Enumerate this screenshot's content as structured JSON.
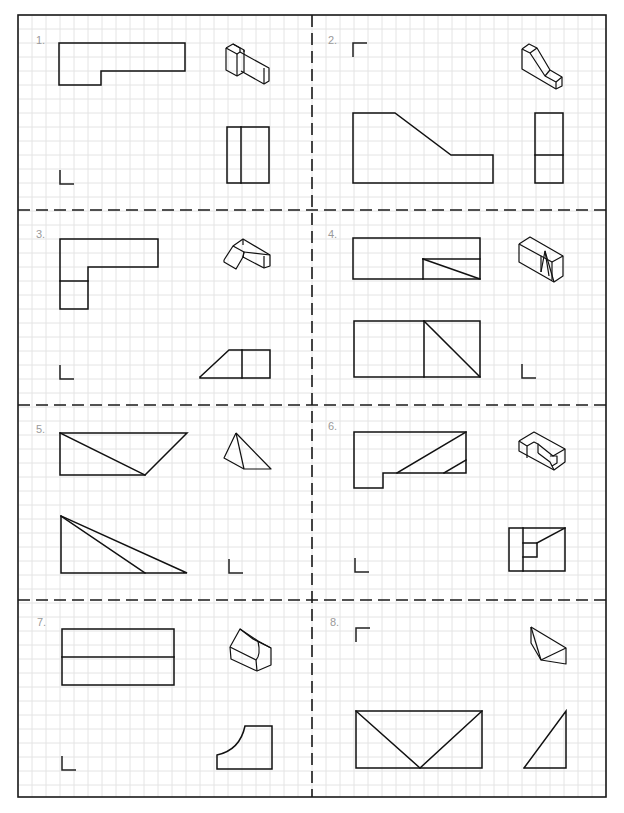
{
  "worksheet": {
    "width": 624,
    "height": 813,
    "grid": {
      "pitch": 14,
      "origin_x": 18,
      "origin_y": 15,
      "color": "#e4e4e4"
    },
    "frame": {
      "x": 18,
      "y": 15,
      "w": 588,
      "h": 782,
      "color": "#1a1a1a"
    },
    "dividers": {
      "vertical_x": 312,
      "horizontal_y": [
        210,
        405,
        600
      ]
    }
  },
  "problems": [
    {
      "number": "1.",
      "label_pos": [
        36,
        44
      ],
      "front_view": [
        [
          [
            59,
            43
          ],
          [
            185,
            43
          ],
          [
            185,
            71
          ],
          [
            101,
            71
          ],
          [
            101,
            85
          ],
          [
            59,
            85
          ],
          [
            59,
            43
          ]
        ]
      ],
      "side_view": [
        [
          [
            227,
            127
          ],
          [
            269,
            127
          ],
          [
            269,
            183
          ],
          [
            227,
            183
          ],
          [
            227,
            127
          ]
        ],
        [
          [
            241,
            127
          ],
          [
            241,
            183
          ]
        ]
      ],
      "top_view_marker": {
        "type": "L-bottom-left",
        "x": 60,
        "y": 170
      },
      "isometric": [
        [
          [
            226,
            48
          ],
          [
            233,
            44
          ],
          [
            244,
            50
          ],
          [
            244,
            72
          ],
          [
            237,
            76
          ],
          [
            226,
            70
          ],
          [
            226,
            48
          ]
        ],
        [
          [
            233,
            44
          ],
          [
            240,
            48
          ],
          [
            240,
            52
          ]
        ],
        [
          [
            237,
            54
          ],
          [
            237,
            76
          ]
        ],
        [
          [
            240,
            52
          ],
          [
            269,
            68
          ],
          [
            269,
            81
          ],
          [
            264,
            84
          ],
          [
            241,
            71
          ]
        ],
        [
          [
            244,
            50
          ],
          [
            244,
            52
          ]
        ],
        [
          [
            264,
            68
          ],
          [
            264,
            84
          ]
        ],
        [
          [
            226,
            48
          ],
          [
            237,
            54
          ],
          [
            240,
            52
          ]
        ]
      ]
    },
    {
      "number": "2.",
      "label_pos": [
        328,
        44
      ],
      "front_view": [
        [
          [
            353,
            113
          ],
          [
            395,
            113
          ],
          [
            451,
            155
          ],
          [
            493,
            155
          ],
          [
            493,
            183
          ],
          [
            353,
            183
          ],
          [
            353,
            113
          ]
        ]
      ],
      "side_view": [
        [
          [
            535,
            113
          ],
          [
            563,
            113
          ],
          [
            563,
            183
          ],
          [
            535,
            183
          ],
          [
            535,
            113
          ]
        ],
        [
          [
            535,
            155
          ],
          [
            563,
            155
          ]
        ]
      ],
      "top_view_marker": {
        "type": "L-top-left",
        "x": 353,
        "y": 43
      },
      "isometric": [
        [
          [
            522,
            49
          ],
          [
            529,
            44
          ],
          [
            537,
            48
          ],
          [
            550,
            70
          ],
          [
            562,
            77
          ],
          [
            562,
            86
          ],
          [
            556,
            89
          ],
          [
            522,
            69
          ],
          [
            522,
            49
          ]
        ],
        [
          [
            522,
            49
          ],
          [
            530,
            53
          ],
          [
            545,
            76
          ],
          [
            556,
            82
          ],
          [
            556,
            89
          ]
        ],
        [
          [
            530,
            53
          ],
          [
            537,
            48
          ]
        ],
        [
          [
            545,
            76
          ],
          [
            550,
            70
          ]
        ],
        [
          [
            556,
            82
          ],
          [
            562,
            77
          ]
        ]
      ]
    },
    {
      "number": "3.",
      "label_pos": [
        36,
        238
      ],
      "front_view": [
        [
          [
            60,
            239
          ],
          [
            158,
            239
          ],
          [
            158,
            267
          ],
          [
            88,
            267
          ],
          [
            88,
            309
          ],
          [
            60,
            309
          ],
          [
            60,
            239
          ]
        ],
        [
          [
            60,
            281
          ],
          [
            88,
            281
          ]
        ]
      ],
      "side_view": [
        [
          [
            200,
            377
          ],
          [
            229,
            350
          ],
          [
            270,
            350
          ],
          [
            270,
            378
          ],
          [
            200,
            378
          ],
          [
            200,
            377
          ]
        ],
        [
          [
            242,
            350
          ],
          [
            242,
            378
          ]
        ]
      ],
      "top_view_marker": {
        "type": "L-bottom-left",
        "x": 60,
        "y": 365
      },
      "isometric": [
        [
          [
            224,
            260
          ],
          [
            233,
            246
          ],
          [
            243,
            239
          ],
          [
            270,
            255
          ],
          [
            270,
            266
          ],
          [
            264,
            268
          ],
          [
            243,
            257
          ],
          [
            236,
            269
          ],
          [
            224,
            262
          ],
          [
            224,
            260
          ]
        ],
        [
          [
            233,
            246
          ],
          [
            244,
            252
          ],
          [
            243,
            257
          ]
        ],
        [
          [
            244,
            252
          ],
          [
            270,
            255
          ]
        ],
        [
          [
            243,
            239
          ],
          [
            243,
            245
          ]
        ],
        [
          [
            264,
            256
          ],
          [
            264,
            268
          ]
        ],
        [
          [
            243,
            257
          ],
          [
            244,
            252
          ]
        ]
      ]
    },
    {
      "number": "4.",
      "label_pos": [
        328,
        238
      ],
      "front_view": [
        [
          [
            353,
            238
          ],
          [
            480,
            238
          ],
          [
            480,
            279
          ],
          [
            353,
            279
          ],
          [
            353,
            238
          ]
        ],
        [
          [
            423,
            259
          ],
          [
            480,
            259
          ]
        ],
        [
          [
            423,
            259
          ],
          [
            423,
            279
          ]
        ],
        [
          [
            423,
            259
          ],
          [
            480,
            279
          ]
        ]
      ],
      "side_view": [
        [
          [
            354,
            321
          ],
          [
            480,
            321
          ],
          [
            480,
            377
          ],
          [
            354,
            377
          ],
          [
            354,
            321
          ]
        ],
        [
          [
            424,
            321
          ],
          [
            424,
            377
          ]
        ],
        [
          [
            424,
            321
          ],
          [
            480,
            377
          ]
        ]
      ],
      "top_view_marker": {
        "type": "L-bottom-left",
        "x": 522,
        "y": 364
      },
      "isometric": [
        [
          [
            519,
            244
          ],
          [
            530,
            237
          ],
          [
            563,
            256
          ],
          [
            563,
            276
          ],
          [
            554,
            282
          ],
          [
            519,
            262
          ],
          [
            519,
            244
          ]
        ],
        [
          [
            519,
            244
          ],
          [
            541,
            256
          ],
          [
            541,
            272
          ]
        ],
        [
          [
            541,
            256
          ],
          [
            552,
            262
          ],
          [
            563,
            256
          ]
        ],
        [
          [
            541,
            272
          ],
          [
            545,
            251
          ],
          [
            554,
            282
          ]
        ],
        [
          [
            545,
            251
          ],
          [
            549,
            276
          ]
        ],
        [
          [
            552,
            262
          ],
          [
            552,
            280
          ]
        ]
      ]
    },
    {
      "number": "5.",
      "label_pos": [
        36,
        433
      ],
      "front_view": [
        [
          [
            60,
            433
          ],
          [
            187,
            433
          ],
          [
            145,
            475
          ],
          [
            60,
            475
          ],
          [
            60,
            433
          ]
        ],
        [
          [
            60,
            433
          ],
          [
            145,
            475
          ]
        ]
      ],
      "side_view": [
        [
          [
            61,
            516
          ],
          [
            61,
            573
          ],
          [
            187,
            573
          ],
          [
            61,
            516
          ]
        ],
        [
          [
            61,
            516
          ],
          [
            145,
            573
          ]
        ]
      ],
      "top_view_marker": {
        "type": "L-bottom-left",
        "x": 229,
        "y": 559
      },
      "isometric": [
        [
          [
            236,
            433
          ],
          [
            224,
            458
          ],
          [
            244,
            469
          ],
          [
            271,
            469
          ],
          [
            236,
            433
          ]
        ],
        [
          [
            236,
            433
          ],
          [
            244,
            469
          ]
        ]
      ]
    },
    {
      "number": "6.",
      "label_pos": [
        328,
        430
      ],
      "front_view": [
        [
          [
            354,
            432
          ],
          [
            466,
            432
          ],
          [
            466,
            473
          ],
          [
            383,
            473
          ],
          [
            383,
            488
          ],
          [
            354,
            488
          ],
          [
            354,
            432
          ]
        ],
        [
          [
            397,
            473
          ],
          [
            466,
            432
          ]
        ],
        [
          [
            444,
            473
          ],
          [
            466,
            460
          ]
        ]
      ],
      "side_view": [
        [
          [
            509,
            528
          ],
          [
            565,
            528
          ],
          [
            565,
            571
          ],
          [
            509,
            571
          ],
          [
            509,
            528
          ]
        ],
        [
          [
            523,
            528
          ],
          [
            523,
            571
          ]
        ],
        [
          [
            523,
            543
          ],
          [
            537,
            543
          ],
          [
            537,
            557
          ],
          [
            523,
            557
          ]
        ],
        [
          [
            537,
            543
          ],
          [
            565,
            528
          ]
        ]
      ],
      "top_view_marker": {
        "type": "L-bottom-left",
        "x": 355,
        "y": 558
      },
      "isometric": [
        [
          [
            519,
            441
          ],
          [
            534,
            432
          ],
          [
            565,
            449
          ],
          [
            565,
            462
          ],
          [
            554,
            470
          ],
          [
            519,
            451
          ],
          [
            519,
            441
          ]
        ],
        [
          [
            519,
            441
          ],
          [
            527,
            446
          ],
          [
            527,
            458
          ]
        ],
        [
          [
            527,
            446
          ],
          [
            534,
            442
          ],
          [
            538,
            444
          ],
          [
            538,
            453
          ]
        ],
        [
          [
            538,
            444
          ],
          [
            553,
            456
          ],
          [
            565,
            449
          ]
        ],
        [
          [
            538,
            453
          ],
          [
            550,
            462
          ],
          [
            554,
            470
          ]
        ],
        [
          [
            550,
            456
          ],
          [
            557,
            456
          ],
          [
            557,
            463
          ],
          [
            552,
            466
          ]
        ]
      ]
    },
    {
      "number": "7.",
      "label_pos": [
        37,
        626
      ],
      "front_view": [
        [
          [
            62,
            629
          ],
          [
            174,
            629
          ],
          [
            174,
            685
          ],
          [
            62,
            685
          ],
          [
            62,
            629
          ]
        ],
        [
          [
            62,
            657
          ],
          [
            174,
            657
          ]
        ]
      ],
      "side_view": [
        [
          [
            217,
            758
          ],
          [
            217,
            755
          ],
          "Q",
          [
            240,
            750
          ],
          [
            245,
            726
          ],
          [
            272,
            726
          ],
          [
            272,
            769
          ],
          [
            217,
            769
          ],
          [
            217,
            758
          ]
        ]
      ],
      "top_view_marker": {
        "type": "L-bottom-left",
        "x": 62,
        "y": 756
      },
      "isometric": [
        [
          [
            230,
            647
          ],
          [
            240,
            629
          ],
          [
            253,
            639
          ],
          [
            271,
            648
          ],
          [
            271,
            665
          ],
          [
            257,
            671
          ],
          [
            231,
            659
          ],
          [
            230,
            647
          ]
        ],
        [
          [
            230,
            647
          ],
          [
            256,
            660
          ],
          [
            257,
            671
          ]
        ],
        [
          [
            240,
            629
          ],
          [
            258,
            641
          ],
          [
            271,
            648
          ]
        ],
        [
          [
            256,
            660
          ],
          "Q",
          [
            261,
            655
          ],
          [
            258,
            641
          ]
        ]
      ]
    },
    {
      "number": "8.",
      "label_pos": [
        330,
        626
      ],
      "front_view": [
        [
          [
            356,
            711
          ],
          [
            482,
            711
          ],
          [
            482,
            768
          ],
          [
            356,
            768
          ],
          [
            356,
            711
          ]
        ],
        [
          [
            356,
            711
          ],
          [
            420,
            768
          ],
          [
            482,
            711
          ]
        ]
      ],
      "side_view": [
        [
          [
            524,
            768
          ],
          [
            566,
            711
          ],
          [
            566,
            768
          ],
          [
            524,
            768
          ]
        ]
      ],
      "top_view_marker": {
        "type": "L-top-left",
        "x": 356,
        "y": 628
      },
      "isometric": [
        [
          [
            531,
            627
          ],
          [
            566,
            648
          ],
          [
            566,
            664
          ],
          [
            541,
            660
          ],
          [
            531,
            643
          ],
          [
            531,
            627
          ]
        ],
        [
          [
            531,
            627
          ],
          [
            541,
            660
          ]
        ],
        [
          [
            541,
            660
          ],
          [
            566,
            648
          ]
        ]
      ]
    }
  ]
}
